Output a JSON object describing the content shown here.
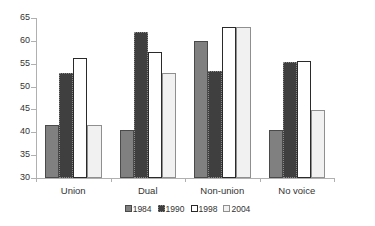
{
  "chart_data": {
    "type": "bar",
    "title": "",
    "subtitle": "",
    "xlabel": "",
    "ylabel": "",
    "ylim": [
      30,
      65
    ],
    "ytick_labels": [
      "65",
      "60",
      "55",
      "50",
      "45",
      "40",
      "35",
      "30"
    ],
    "ytick_values": [
      65,
      60,
      55,
      50,
      45,
      40,
      35,
      30
    ],
    "grid": false,
    "legend_position": "bottom",
    "categories": [
      "Union",
      "Dual",
      "Non-union",
      "No voice"
    ],
    "series": [
      {
        "name": "1984",
        "color": "#808080",
        "values": [
          41.5,
          40.5,
          60.0,
          40.5
        ]
      },
      {
        "name": "1990",
        "color": "#3f3f3f",
        "values": [
          53.0,
          62.0,
          53.5,
          55.3
        ]
      },
      {
        "name": "1998",
        "color": "#ffffff",
        "values": [
          56.2,
          57.5,
          63.0,
          55.5
        ]
      },
      {
        "name": "2004",
        "color": "#f1f1f1",
        "values": [
          41.6,
          53.0,
          63.0,
          44.8
        ]
      }
    ]
  },
  "legend": {
    "items": [
      {
        "label": "1984"
      },
      {
        "label": "1990"
      },
      {
        "label": "1998"
      },
      {
        "label": "2004"
      }
    ]
  },
  "axis": {
    "y_labels": [
      "65",
      "60",
      "55",
      "50",
      "45",
      "40",
      "35",
      "30"
    ],
    "x_labels": [
      "Union",
      "Dual",
      "Non-union",
      "No voice"
    ]
  }
}
